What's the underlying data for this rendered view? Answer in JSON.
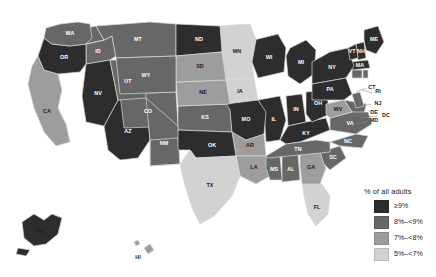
{
  "chart_data": {
    "type": "choropleth_map",
    "title": "",
    "legend_title": "% of all adults",
    "legend_position": "bottom-right",
    "region": "United States (50 states + DC)",
    "color_scale": "sequential grayscale, dark = highest",
    "classes": [
      {
        "label": "≥9%",
        "color": "#2d2d2d",
        "min": 9,
        "max": null
      },
      {
        "label": "8%–<9%",
        "color": "#676767",
        "min": 8,
        "max": 9
      },
      {
        "label": "7%–<8%",
        "color": "#9d9d9d",
        "min": 7,
        "max": 8
      },
      {
        "label": "5%–<7%",
        "color": "#d2d2d2",
        "min": 5,
        "max": 7
      }
    ],
    "categories": [
      "AL",
      "AK",
      "AZ",
      "AR",
      "CA",
      "CO",
      "CT",
      "DE",
      "DC",
      "FL",
      "GA",
      "HI",
      "ID",
      "IL",
      "IN",
      "IA",
      "KS",
      "KY",
      "LA",
      "ME",
      "MD",
      "MA",
      "MI",
      "MN",
      "MS",
      "MO",
      "MT",
      "NE",
      "NV",
      "NH",
      "NJ",
      "NM",
      "NY",
      "NC",
      "ND",
      "OH",
      "OK",
      "OR",
      "PA",
      "RI",
      "SC",
      "SD",
      "TN",
      "TX",
      "UT",
      "VT",
      "VA",
      "WA",
      "WV",
      "WI",
      "WY"
    ],
    "values": [
      {
        "state": "AL",
        "abbr": "AL",
        "class": 1,
        "label": "8%–<9%"
      },
      {
        "state": "AK",
        "abbr": "AK",
        "class": 0,
        "label": "≥9%"
      },
      {
        "state": "AZ",
        "abbr": "AZ",
        "class": 0,
        "label": "≥9%"
      },
      {
        "state": "AR",
        "abbr": "AR",
        "class": 2,
        "label": "7%–<8%"
      },
      {
        "state": "CA",
        "abbr": "CA",
        "class": 2,
        "label": "7%–<8%"
      },
      {
        "state": "CO",
        "abbr": "CO",
        "class": 1,
        "label": "8%–<9%"
      },
      {
        "state": "CT",
        "abbr": "CT",
        "class": 1,
        "label": "8%–<9%"
      },
      {
        "state": "DE",
        "abbr": "DE",
        "class": 1,
        "label": "8%–<9%"
      },
      {
        "state": "DC",
        "abbr": "DC",
        "class": 1,
        "label": "8%–<9%"
      },
      {
        "state": "FL",
        "abbr": "FL",
        "class": 3,
        "label": "5%–<7%"
      },
      {
        "state": "GA",
        "abbr": "GA",
        "class": 2,
        "label": "7%–<8%"
      },
      {
        "state": "HI",
        "abbr": "HI",
        "class": 2,
        "label": "7%–<8%"
      },
      {
        "state": "ID",
        "abbr": "ID",
        "class": 1,
        "label": "8%–<9%"
      },
      {
        "state": "IL",
        "abbr": "IL",
        "class": 0,
        "label": "≥9%"
      },
      {
        "state": "IN",
        "abbr": "IN",
        "class": 0,
        "label": "≥9%"
      },
      {
        "state": "IA",
        "abbr": "IA",
        "class": 3,
        "label": "5%–<7%"
      },
      {
        "state": "KS",
        "abbr": "KS",
        "class": 1,
        "label": "8%–<9%"
      },
      {
        "state": "KY",
        "abbr": "KY",
        "class": 0,
        "label": "≥9%"
      },
      {
        "state": "LA",
        "abbr": "LA",
        "class": 2,
        "label": "7%–<8%"
      },
      {
        "state": "ME",
        "abbr": "ME",
        "class": 0,
        "label": "≥9%"
      },
      {
        "state": "MD",
        "abbr": "MD",
        "class": 1,
        "label": "8%–<9%"
      },
      {
        "state": "MA",
        "abbr": "MA",
        "class": 0,
        "label": "≥9%"
      },
      {
        "state": "MI",
        "abbr": "MI",
        "class": 0,
        "label": "≥9%"
      },
      {
        "state": "MN",
        "abbr": "MN",
        "class": 3,
        "label": "5%–<7%"
      },
      {
        "state": "MS",
        "abbr": "MS",
        "class": 1,
        "label": "8%–<9%"
      },
      {
        "state": "MO",
        "abbr": "MO",
        "class": 0,
        "label": "≥9%"
      },
      {
        "state": "MT",
        "abbr": "MT",
        "class": 1,
        "label": "8%–<9%"
      },
      {
        "state": "NE",
        "abbr": "NE",
        "class": 2,
        "label": "7%–<8%"
      },
      {
        "state": "NV",
        "abbr": "NV",
        "class": 0,
        "label": "≥9%"
      },
      {
        "state": "NH",
        "abbr": "NH",
        "class": 0,
        "label": "≥9%"
      },
      {
        "state": "NJ",
        "abbr": "NJ",
        "class": 1,
        "label": "8%–<9%"
      },
      {
        "state": "NM",
        "abbr": "NM",
        "class": 1,
        "label": "8%–<9%"
      },
      {
        "state": "NY",
        "abbr": "NY",
        "class": 0,
        "label": "≥9%"
      },
      {
        "state": "NC",
        "abbr": "NC",
        "class": 1,
        "label": "8%–<9%"
      },
      {
        "state": "ND",
        "abbr": "ND",
        "class": 0,
        "label": "≥9%"
      },
      {
        "state": "OH",
        "abbr": "OH",
        "class": 0,
        "label": "≥9%"
      },
      {
        "state": "OK",
        "abbr": "OK",
        "class": 0,
        "label": "≥9%"
      },
      {
        "state": "OR",
        "abbr": "OR",
        "class": 0,
        "label": "≥9%"
      },
      {
        "state": "PA",
        "abbr": "PA",
        "class": 0,
        "label": "≥9%"
      },
      {
        "state": "RI",
        "abbr": "RI",
        "class": 1,
        "label": "8%–<9%"
      },
      {
        "state": "SC",
        "abbr": "SC",
        "class": 1,
        "label": "8%–<9%"
      },
      {
        "state": "SD",
        "abbr": "SD",
        "class": 2,
        "label": "7%–<8%"
      },
      {
        "state": "TN",
        "abbr": "TN",
        "class": 1,
        "label": "8%–<9%"
      },
      {
        "state": "TX",
        "abbr": "TX",
        "class": 3,
        "label": "5%–<7%"
      },
      {
        "state": "UT",
        "abbr": "UT",
        "class": 1,
        "label": "8%–<9%"
      },
      {
        "state": "VT",
        "abbr": "VT",
        "class": 0,
        "label": "≥9%"
      },
      {
        "state": "VA",
        "abbr": "VA",
        "class": 1,
        "label": "8%–<9%"
      },
      {
        "state": "WA",
        "abbr": "WA",
        "class": 1,
        "label": "8%–<9%"
      },
      {
        "state": "WV",
        "abbr": "WV",
        "class": 2,
        "label": "7%–<8%"
      },
      {
        "state": "WI",
        "abbr": "WI",
        "class": 0,
        "label": "≥9%"
      },
      {
        "state": "WY",
        "abbr": "WY",
        "class": 1,
        "label": "8%–<9%"
      }
    ]
  },
  "legend": {
    "title": "% of all adults",
    "items": [
      {
        "label": "≥9%",
        "color": "#2d2d2d"
      },
      {
        "label": "8%–<9%",
        "color": "#676767"
      },
      {
        "label": "7%–<8%",
        "color": "#9d9d9d"
      },
      {
        "label": "5%–<7%",
        "color": "#d2d2d2"
      }
    ]
  },
  "colors": {
    "background": "#ffffff",
    "border": "#d8d8d8",
    "text": "#1d1d1d",
    "label_on_dark": "#ffffff",
    "label_on_light": "#1a1a1a"
  }
}
